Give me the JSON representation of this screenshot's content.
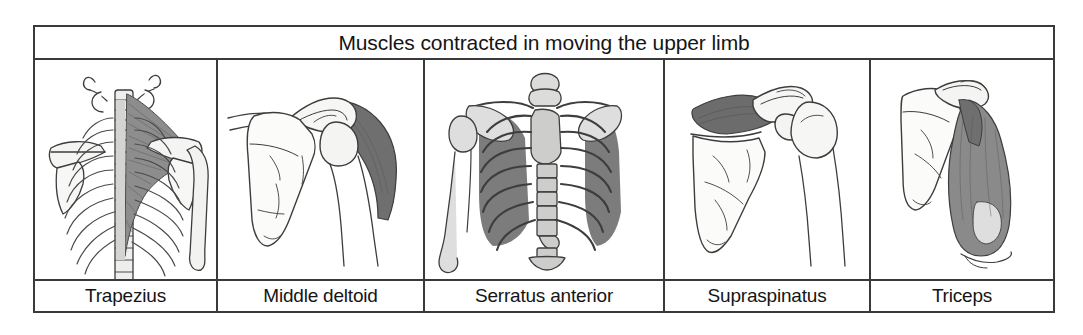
{
  "figure": {
    "title": "Muscles contracted in moving the upper limb",
    "columns": [
      {
        "label": "Trapezius",
        "illustration": "posterior-thorax-trapezius-illustration",
        "view": "Posterior view of cervical and thoracic spine, ribcage, scapulae and right humerus with the trapezius muscle shaded on the left side of the figure",
        "shaded_muscle": "trapezius"
      },
      {
        "label": "Middle deltoid",
        "illustration": "posterior-scapula-middle-deltoid-illustration",
        "view": "Posterior view of scapula, clavicle and proximal humerus with the middle deltoid shaded dark over the acromion and lateral humerus",
        "shaded_muscle": "middle deltoid"
      },
      {
        "label": "Serratus anterior",
        "illustration": "anterior-ribcage-serratus-anterior-illustration",
        "view": "Anterior view of the ribcage, sternum, clavicles, scapulae and left humerus with serratus anterior shaded over the lateral ribs",
        "shaded_muscle": "serratus anterior"
      },
      {
        "label": "Supraspinatus",
        "illustration": "posterior-scapula-supraspinatus-illustration",
        "view": "Posterior view of scapula and humerus with the supraspinatus shaded dark within the supraspinous fossa",
        "shaded_muscle": "supraspinatus"
      },
      {
        "label": "Triceps",
        "illustration": "posterior-humerus-triceps-illustration",
        "view": "Posterior view of scapula and humerus with the triceps brachii shaded along the posterior arm",
        "shaded_muscle": "triceps"
      }
    ]
  },
  "colors": {
    "border": "#3a3a3a",
    "text": "#151515",
    "page_background": "#ffffff",
    "bone_light": "#e8e8e6",
    "bone_mid": "#c8c8c6",
    "muscle_mid": "#8a8a8a",
    "muscle_dark": "#6e6e6e",
    "outline": "#3d3d3d"
  }
}
